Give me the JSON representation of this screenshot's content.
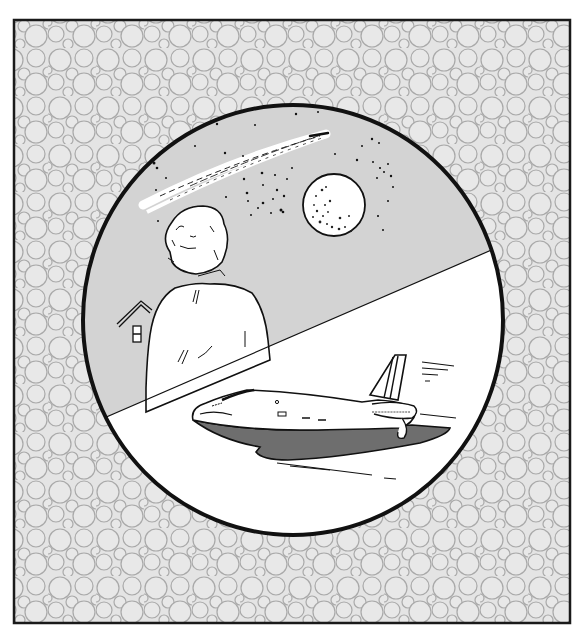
{
  "illustration": {
    "title": "Observer watching night sky and space shuttle",
    "frame": {
      "x": 14,
      "y": 20,
      "width": 556,
      "height": 603,
      "pattern": "circle-tessellation",
      "pattern_color": "#a8a8a8",
      "fill_color": "#e6e6e6",
      "border_color": "#1a1a1a"
    },
    "medallion": {
      "cx": 293,
      "cy": 320,
      "rx": 210,
      "ry": 215,
      "border_color": "#111111"
    },
    "upper_scene": {
      "background": "#d3d3d3",
      "elements": [
        "comet",
        "stars",
        "moon",
        "person-from-behind",
        "house-roof"
      ],
      "moon": {
        "cx": 334,
        "cy": 205,
        "r": 31
      }
    },
    "divider": {
      "x1": 106,
      "y1": 417,
      "x2": 487,
      "y2": 254
    },
    "lower_scene": {
      "background": "#ffffff",
      "elements": [
        "space-shuttle",
        "speed-lines"
      ],
      "shuttle_shadow_color": "#6e6e6e"
    },
    "colors": {
      "ink": "#111111",
      "sky": "#d3d3d3",
      "paper": "#ffffff",
      "shadow": "#6e6e6e"
    }
  },
  "caption": {
    "visible": "partially cut off at bottom edge",
    "text": ""
  }
}
